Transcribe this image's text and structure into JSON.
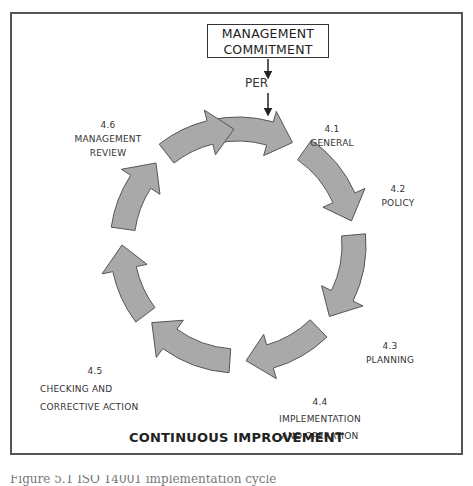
{
  "header": {
    "box_line1": "MANAGEMENT",
    "box_line2": "COMMITMENT",
    "per_label": "PER"
  },
  "stages": [
    {
      "number": "4.1",
      "line1": "GENERAL",
      "line2": ""
    },
    {
      "number": "4.2",
      "line1": "POLICY",
      "line2": ""
    },
    {
      "number": "4.3",
      "line1": "PLANNING",
      "line2": ""
    },
    {
      "number": "4.4",
      "line1": "IMPLEMENTATION",
      "line2": "AND OPERATION"
    },
    {
      "number": "4.5",
      "line1": "CHECKING AND",
      "line2": "CORRECTIVE ACTION"
    },
    {
      "number": "4.6",
      "line1": "MANAGEMENT",
      "line2": "REVIEW"
    }
  ],
  "footer": {
    "title": "CONTINUOUS IMPROVEMENT",
    "caption": "Figure 5.1 ISO 14001 implementation cycle"
  },
  "colors": {
    "arrow_fill": "#a9a9a9",
    "arrow_stroke": "#555555",
    "frame": "#555555"
  },
  "cycle": {
    "cx": 238,
    "cy": 245,
    "r_outer": 128,
    "r_inner": 104,
    "arrows": [
      {
        "start": -103,
        "end": -62
      },
      {
        "start": -55,
        "end": -12
      },
      {
        "start": -5,
        "end": 38
      },
      {
        "start": 46,
        "end": 86
      },
      {
        "start": 94,
        "end": 138
      },
      {
        "start": 143,
        "end": 180
      },
      {
        "start": 188,
        "end": 225
      },
      {
        "start": 232,
        "end": 268
      }
    ]
  }
}
